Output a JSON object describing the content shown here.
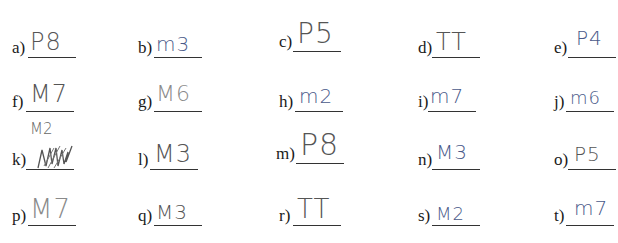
{
  "worksheet": {
    "items": [
      {
        "label": "a)",
        "answer": "P8"
      },
      {
        "label": "b)",
        "answer": "m3"
      },
      {
        "label": "c)",
        "answer": "P5"
      },
      {
        "label": "d)",
        "answer": "TT"
      },
      {
        "label": "e)",
        "answer": "P4"
      },
      {
        "label": "f)",
        "answer": "M7"
      },
      {
        "label": "g)",
        "answer": "M6"
      },
      {
        "label": "h)",
        "answer": "m2"
      },
      {
        "label": "i)",
        "answer": "m7"
      },
      {
        "label": "j)",
        "answer": "m6"
      },
      {
        "label": "k)",
        "answer": "M3",
        "correction": "M2"
      },
      {
        "label": "l)",
        "answer": "M3"
      },
      {
        "label": "m)",
        "answer": "P8"
      },
      {
        "label": "n)",
        "answer": "M3"
      },
      {
        "label": "o)",
        "answer": "P5"
      },
      {
        "label": "p)",
        "answer": "M7"
      },
      {
        "label": "q)",
        "answer": "M3"
      },
      {
        "label": "r)",
        "answer": "TT"
      },
      {
        "label": "s)",
        "answer": "M2"
      },
      {
        "label": "t)",
        "answer": "m7"
      }
    ]
  }
}
